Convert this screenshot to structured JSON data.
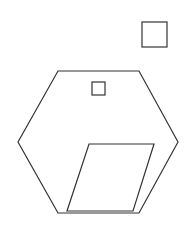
{
  "canvas": {
    "width": 188,
    "height": 231,
    "background": "#ffffff"
  },
  "stroke": {
    "color": "#333333",
    "width": 1.2
  },
  "shapes": {
    "hexagon": {
      "points": "58,71 139,71 178,142 139,213 58,213 18,142"
    },
    "small_square": {
      "x": 92,
      "y": 82,
      "width": 13,
      "height": 13
    },
    "top_right_square": {
      "x": 142,
      "y": 22,
      "width": 25,
      "height": 25
    },
    "parallelogram": {
      "points": "89,144 154,144 133,211 67,211"
    }
  }
}
